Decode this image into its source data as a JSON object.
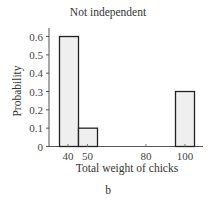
{
  "chart_data": {
    "type": "bar",
    "title": "Not independent",
    "subtitle_label": "b",
    "xlabel": "Total weight of chicks",
    "ylabel": "Probability",
    "categories": [
      "40",
      "50",
      "100"
    ],
    "values": [
      0.6,
      0.1,
      0.3
    ],
    "x_ticks": [
      "40",
      "50",
      "80",
      "100"
    ],
    "y_ticks": [
      "0",
      "0.1",
      "0.2",
      "0.3",
      "0.4",
      "0.5",
      "0.6"
    ],
    "ylim": [
      0,
      0.65
    ],
    "grid": false,
    "legend": null,
    "bar_fill": "#efefef",
    "bar_stroke": "#222222"
  },
  "labels": {
    "title": "Not independent",
    "xlabel": "Total weight of chicks",
    "ylabel": "Probability",
    "panel": "b"
  }
}
